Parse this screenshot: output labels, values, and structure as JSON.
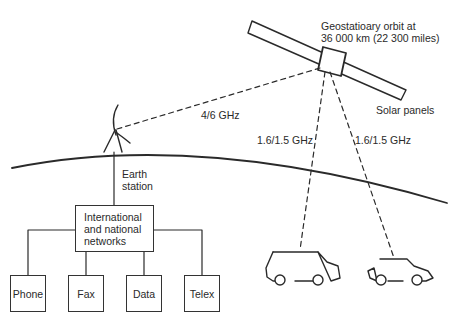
{
  "diagram": {
    "satellite": {
      "orbit_label_line1": "Geostatioary orbit at",
      "orbit_label_line2": "36 000 km (22 300 miles)",
      "panels_label": "Solar panels"
    },
    "links": {
      "ground_uplink": "4/6 GHz",
      "mobile_link_1": "1.6/1.5 GHz",
      "mobile_link_2": "1.6/1.5 GHz"
    },
    "earth_station": {
      "label_line1": "Earth",
      "label_line2": "station"
    },
    "network": {
      "label": "International\nand national\nnetworks"
    },
    "terminals": [
      {
        "label": "Phone"
      },
      {
        "label": "Fax"
      },
      {
        "label": "Data"
      },
      {
        "label": "Telex"
      }
    ],
    "vehicles": [
      {
        "type": "van"
      },
      {
        "type": "car"
      }
    ],
    "colors": {
      "ink": "#2a2a2a",
      "background": "#ffffff"
    }
  }
}
